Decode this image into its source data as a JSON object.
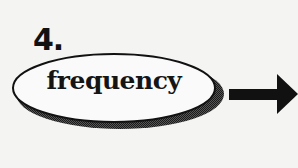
{
  "diagram": {
    "step_number": "4.",
    "node": {
      "label": "frequency",
      "shape": "ellipse-with-drop-shadow"
    },
    "connector": {
      "icon": "arrow-right-icon",
      "direction": "right"
    },
    "colors": {
      "background": "#f4f4f2",
      "ink": "#111111",
      "ellipse_fill": "#fafafa",
      "shadow": "#3a3a3a"
    }
  }
}
